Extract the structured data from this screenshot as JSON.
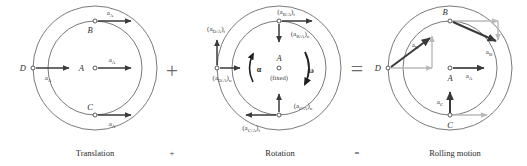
{
  "figure": {
    "background_color": "#ffffff",
    "circle_stroke_color": "#6b6b6b",
    "arrow_dark_color": "#3a3a3a",
    "arrow_light_color": "#b9b9b9",
    "text_color": "#2e2e2e"
  },
  "captions": {
    "translation": "Translation",
    "plus": "+",
    "rotation": "Rotation",
    "equals": "=",
    "rolling": "Rolling motion"
  },
  "operators": {
    "plus_symbol": "+",
    "equals_symbol": "="
  },
  "panels": [
    {
      "id": "translation",
      "caption": "Translation",
      "center_label": "A",
      "points": [
        "A",
        "B",
        "C",
        "D"
      ],
      "vectors": [
        {
          "name": "a_B",
          "label_base": "a",
          "label_sub": "A",
          "at_point": "B",
          "direction": "right",
          "color": "#3a3a3a"
        },
        {
          "name": "a_A",
          "label_base": "a",
          "label_sub": "A",
          "at_point": "A",
          "direction": "right",
          "color": "#3a3a3a"
        },
        {
          "name": "a_C",
          "label_base": "a",
          "label_sub": "A",
          "at_point": "C",
          "direction": "right",
          "color": "#3a3a3a"
        },
        {
          "name": "a_D",
          "label_base": "a",
          "label_sub": "A",
          "at_point": "D",
          "direction": "right",
          "color": "#3a3a3a"
        }
      ]
    },
    {
      "id": "rotation",
      "caption": "Rotation",
      "center_label": "A",
      "center_note": "(fixed)",
      "alpha_symbol": "α",
      "omega_symbol": "ω",
      "vectors": [
        {
          "name": "aBA_t",
          "base": "a",
          "sub": "B/A",
          "comp": "t",
          "at_point": "B",
          "direction": "right"
        },
        {
          "name": "aBA_n",
          "base": "a",
          "sub": "B/A",
          "comp": "n",
          "at_point": "B",
          "direction": "down"
        },
        {
          "name": "aDA_t",
          "base": "a",
          "sub": "D/A",
          "comp": "t",
          "at_point": "D",
          "direction": "up"
        },
        {
          "name": "aDA_n",
          "base": "a",
          "sub": "D/A",
          "comp": "n",
          "at_point": "D",
          "direction": "right"
        },
        {
          "name": "aCA_t",
          "base": "a",
          "sub": "C/A",
          "comp": "t",
          "at_point": "C",
          "direction": "left"
        },
        {
          "name": "aCA_n",
          "base": "a",
          "sub": "C/A",
          "comp": "n",
          "at_point": "C",
          "direction": "up"
        }
      ]
    },
    {
      "id": "rolling",
      "caption": "Rolling motion",
      "center_label": "A",
      "points": [
        "A",
        "B",
        "C",
        "D"
      ],
      "vectors": [
        {
          "name": "a_A",
          "label_base": "a",
          "label_sub": "A",
          "at_point": "A",
          "direction": "right",
          "color": "#3a3a3a"
        },
        {
          "name": "a_B",
          "label_base": "a",
          "label_sub": "B",
          "at_point": "B",
          "direction": "down-right",
          "color": "#3a3a3a"
        },
        {
          "name": "a_C",
          "label_base": "a",
          "label_sub": "C",
          "at_point": "C",
          "direction": "up",
          "color": "#3a3a3a"
        },
        {
          "name": "a_D",
          "label_base": "a",
          "label_sub": "D",
          "at_point": "D",
          "direction": "up-right",
          "color": "#3a3a3a"
        }
      ]
    }
  ],
  "point_labels": {
    "A": "A",
    "B": "B",
    "C": "C",
    "D": "D"
  },
  "vector_text": {
    "a": "a",
    "sub_A": "A",
    "sub_B": "B",
    "sub_C": "C",
    "sub_D": "D",
    "sub_BA": "B/A",
    "sub_CA": "C/A",
    "sub_DA": "D/A",
    "comp_t": "t",
    "comp_n": "n",
    "paren_open": "(",
    "paren_close": ")",
    "fixed": "(fixed)",
    "alpha": "α",
    "omega": "ω"
  }
}
